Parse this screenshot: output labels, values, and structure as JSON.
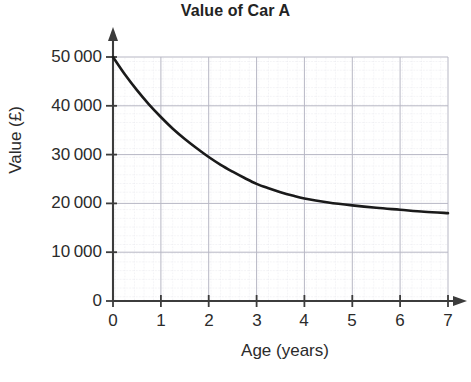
{
  "chart_data": {
    "type": "line",
    "title": "Value of Car A",
    "xlabel": "Age (years)",
    "ylabel": "Value (£)",
    "xlim": [
      0,
      7
    ],
    "ylim": [
      0,
      50000
    ],
    "grid": true,
    "grid_minor": true,
    "legend": "none",
    "line_color": "#1a1a1a",
    "grid_color": "#b9b9c6",
    "minor_grid_color": "#d9d9e2",
    "axis_color": "#3c3c3c",
    "x_ticks": [
      "0",
      "1",
      "2",
      "3",
      "4",
      "5",
      "6",
      "7"
    ],
    "x_tick_values": [
      0,
      1,
      2,
      3,
      4,
      5,
      6,
      7
    ],
    "y_ticks": [
      "0",
      "10 000",
      "20 000",
      "30 000",
      "40 000",
      "50 000"
    ],
    "y_tick_values": [
      0,
      10000,
      20000,
      30000,
      40000,
      50000
    ],
    "series": [
      {
        "name": "Car A value",
        "x": [
          0,
          0.25,
          0.5,
          0.75,
          1,
          1.25,
          1.5,
          1.75,
          2,
          2.25,
          2.5,
          2.75,
          3,
          3.25,
          3.5,
          3.75,
          4,
          4.5,
          5,
          5.5,
          6,
          6.5,
          7
        ],
        "y": [
          50000,
          46400,
          43200,
          40300,
          37700,
          35300,
          33200,
          31300,
          29500,
          27900,
          26500,
          25200,
          24000,
          23100,
          22300,
          21600,
          21000,
          20200,
          19600,
          19100,
          18700,
          18300,
          18000
        ]
      }
    ]
  },
  "geometry": {
    "plot_left": 113,
    "plot_right": 448,
    "plot_top": 57,
    "plot_bottom": 301,
    "y_axis_arrow_top": 28,
    "x_axis_arrow_right": 466
  }
}
